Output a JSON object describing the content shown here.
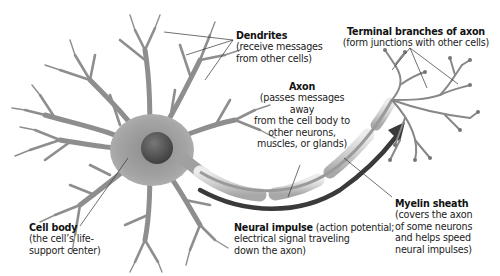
{
  "diagram": {
    "colors": {
      "background": "#ffffff",
      "neuron_fill": "#9a9a9a",
      "neuron_dark": "#5a5a5a",
      "nucleus": "#4a4a4a",
      "myelin": "#d2d2d2",
      "impulse_arrow": "#3a3a3a",
      "leader_lines": "#333333",
      "text": "#222222"
    },
    "labels": {
      "dendrites": {
        "title": "Dendrites",
        "desc_lines": [
          "(receive messages",
          "from other cells)"
        ]
      },
      "terminal_branches": {
        "title": "Terminal branches of axon",
        "desc_lines": [
          "(form junctions with other cells)"
        ]
      },
      "axon": {
        "title": "Axon",
        "desc_lines": [
          "(passes messages away",
          "from the cell body to",
          "other neurons,",
          "muscles, or glands)"
        ]
      },
      "cell_body": {
        "title": "Cell body",
        "desc_lines": [
          "(the cell’s life-",
          "support center)"
        ]
      },
      "neural_impulse": {
        "title": "Neural impulse",
        "title_suffix": " (action potential;",
        "desc_lines": [
          "electrical signal traveling",
          "down the axon)"
        ]
      },
      "myelin_sheath": {
        "title": "Myelin sheath",
        "desc_lines": [
          "(covers the axon",
          "of some neurons",
          "and helps speed",
          "neural impulses)"
        ]
      }
    }
  }
}
